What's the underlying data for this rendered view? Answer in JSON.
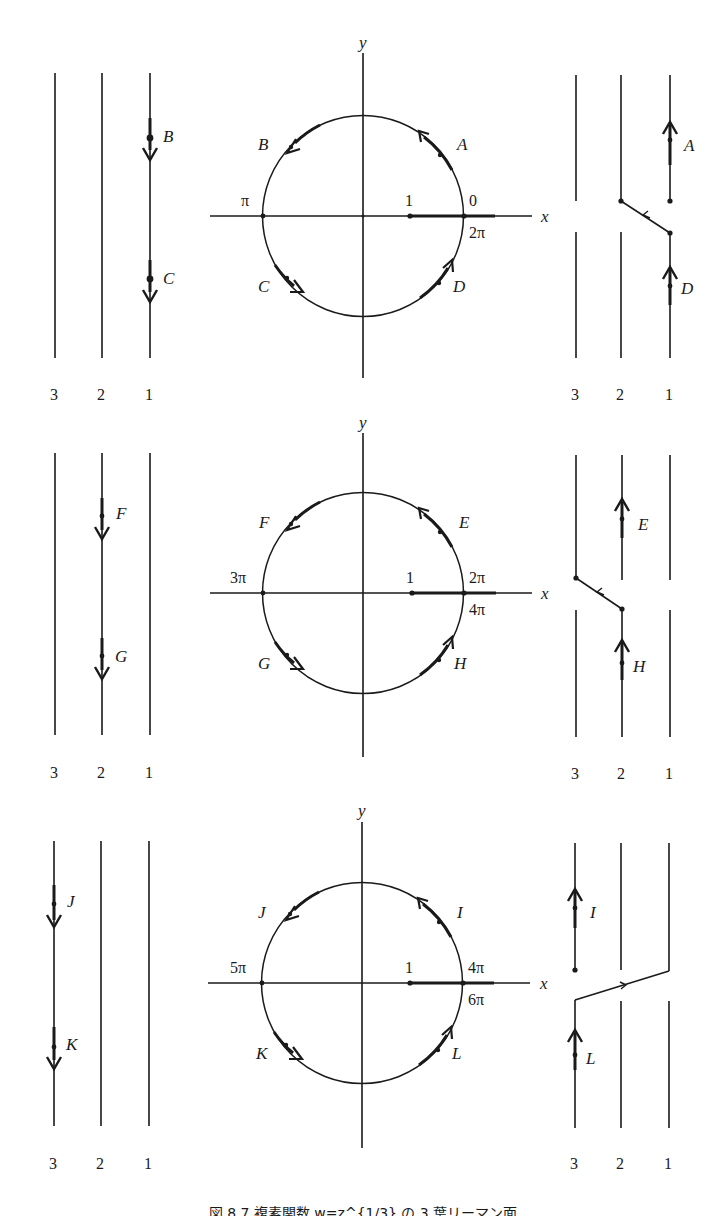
{
  "figure": {
    "caption": "図 8.7 複素関数 w=z^{1/3} の 3 葉リーマン面",
    "axis_labels": {
      "x": "x",
      "y": "y"
    },
    "sheet_labels": [
      "3",
      "2",
      "1"
    ],
    "unit_point_label": "1",
    "colors": {
      "ink": "#1a1a1a",
      "background": "#ffffff"
    },
    "panels": [
      {
        "id": "panel-1",
        "circle_labels": {
          "left": "π",
          "right_top": "0",
          "right_bottom": "2π"
        },
        "circle_arrows": {
          "upper_right": "A",
          "upper_left": "B",
          "lower_left": "C",
          "lower_right": "D"
        },
        "left_sheets": {
          "active_sheet": "1",
          "arrows": [
            "B",
            "C"
          ],
          "direction": "down"
        },
        "right_sheets": {
          "arrows_upper": "A",
          "arrows_lower": "D",
          "transition": "sheet 1 → sheet 2",
          "direction": "up"
        }
      },
      {
        "id": "panel-2",
        "circle_labels": {
          "left": "3π",
          "right_top": "2π",
          "right_bottom": "4π"
        },
        "circle_arrows": {
          "upper_right": "E",
          "upper_left": "F",
          "lower_left": "G",
          "lower_right": "H"
        },
        "left_sheets": {
          "active_sheet": "2",
          "arrows": [
            "F",
            "G"
          ],
          "direction": "down"
        },
        "right_sheets": {
          "arrows_upper": "E",
          "arrows_lower": "H",
          "transition": "sheet 2 → sheet 3",
          "direction": "up"
        }
      },
      {
        "id": "panel-3",
        "circle_labels": {
          "left": "5π",
          "right_top": "4π",
          "right_bottom": "6π"
        },
        "circle_arrows": {
          "upper_right": "I",
          "upper_left": "J",
          "lower_left": "K",
          "lower_right": "L"
        },
        "left_sheets": {
          "active_sheet": "3",
          "arrows": [
            "J",
            "K"
          ],
          "direction": "down"
        },
        "right_sheets": {
          "arrows_upper": "I",
          "arrows_lower": "L",
          "transition": "sheet 3 → sheet 1",
          "direction": "up"
        }
      }
    ]
  }
}
